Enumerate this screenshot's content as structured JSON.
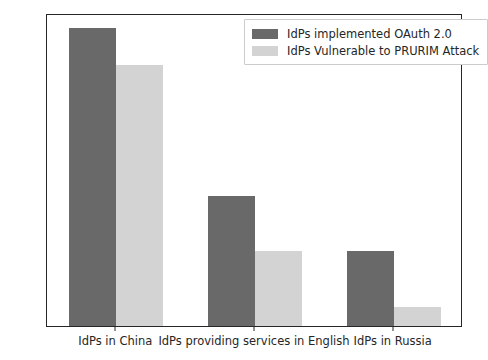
{
  "chart_data": {
    "type": "bar",
    "title": "",
    "xlabel": "",
    "ylabel": "",
    "categories": [
      "IdPs in China",
      "IdPs providing services in English",
      "IdPs in Russia"
    ],
    "series": [
      {
        "name": "IdPs implemented OAuth 2.0",
        "color": "#696969",
        "values": [
          16,
          7,
          4
        ]
      },
      {
        "name": "IdPs Vulnerable to PRURIM Attack",
        "color": "#d3d3d3",
        "values": [
          14,
          4,
          1
        ]
      }
    ],
    "ylim": [
      0,
      16.8
    ],
    "yticks": [
      0,
      2,
      4,
      6,
      8,
      10,
      12,
      14,
      16
    ],
    "ytick_labels": [
      "0",
      "2",
      "4",
      "6",
      "8",
      "10",
      "12",
      "14",
      "16"
    ],
    "grid": false,
    "legend_position": "upper right",
    "frame_color": "#262626",
    "background": "#ffffff"
  }
}
